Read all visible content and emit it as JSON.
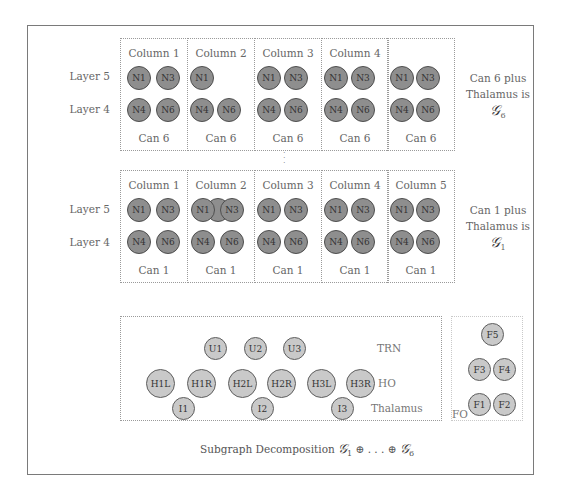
{
  "diagram": {
    "row_labels": {
      "layer5": "Layer 5",
      "layer4": "Layer 4"
    },
    "top_row": {
      "columns": [
        {
          "title": "Column 1",
          "nodes_l5": [
            "N1",
            "N3"
          ],
          "nodes_l4": [
            "N4",
            "N6"
          ],
          "footer": "Can 6"
        },
        {
          "title": "Column 2",
          "nodes_l5": [
            "N1"
          ],
          "nodes_l4": [
            "N4",
            "N6"
          ],
          "footer": "Can 6"
        },
        {
          "title": "Column 3",
          "nodes_l5": [
            "N1",
            "N3"
          ],
          "nodes_l4": [
            "N4",
            "N6"
          ],
          "footer": "Can 6"
        },
        {
          "title": "Column 4",
          "nodes_l5": [
            "N1",
            "N3"
          ],
          "nodes_l4": [
            "N4",
            "N6"
          ],
          "footer": "Can 6"
        },
        {
          "title": "",
          "nodes_l5": [
            "N1",
            "N3"
          ],
          "nodes_l4": [
            "N4",
            "N6"
          ],
          "footer": "Can 6"
        }
      ],
      "note_line1": "Can 6 plus",
      "note_line2": "Thalamus is",
      "note_symbol": "𝒢",
      "note_sub": "6"
    },
    "ellipsis": "⋮",
    "bottom_row": {
      "columns": [
        {
          "title": "Column 1",
          "nodes_l5": [
            "N1",
            "N3"
          ],
          "nodes_l4": [
            "N4",
            "N6"
          ],
          "footer": "Can 1"
        },
        {
          "title": "Column 2",
          "nodes_l5": [
            "N1",
            "N3"
          ],
          "nodes_l4": [
            "N4",
            "N6"
          ],
          "footer": "Can 1"
        },
        {
          "title": "Column 3",
          "nodes_l5": [
            "N1",
            "N3"
          ],
          "nodes_l4": [
            "N4",
            "N6"
          ],
          "footer": "Can 1"
        },
        {
          "title": "Column 4",
          "nodes_l5": [
            "N1",
            "N3"
          ],
          "nodes_l4": [
            "N4",
            "N6"
          ],
          "footer": "Can 1"
        },
        {
          "title": "Column 5",
          "nodes_l5": [
            "N1",
            "N3"
          ],
          "nodes_l4": [
            "N4",
            "N6"
          ],
          "footer": "Can 1"
        }
      ],
      "note_line1": "Can 1 plus",
      "note_line2": "Thalamus is",
      "note_symbol": "𝒢",
      "note_sub": "1"
    },
    "thalamus": {
      "trn_label": "TRN",
      "ho_label": "HO",
      "thalamus_label": "Thalamus",
      "trn_nodes": [
        "U1",
        "U2",
        "U3"
      ],
      "ho_nodes": [
        "H1L",
        "H1R",
        "H2L",
        "H2R",
        "H3L",
        "H3R"
      ],
      "i_nodes": [
        "I1",
        "I2",
        "I3"
      ]
    },
    "fo": {
      "label": "FO",
      "nodes": [
        "F5",
        "F3",
        "F4",
        "F1",
        "F2"
      ]
    },
    "caption": {
      "text": "Subgraph Decomposition",
      "g1": "𝒢",
      "g1_sub": "1",
      "oplus1": "⊕",
      "dots": ". . .",
      "oplus2": "⊕",
      "g6": "𝒢",
      "g6_sub": "6"
    },
    "colors": {
      "cortical_node_fill": "#8e8e8e",
      "thalamic_node_fill": "#c9c9c9",
      "frame": "#7a7a7a"
    }
  }
}
